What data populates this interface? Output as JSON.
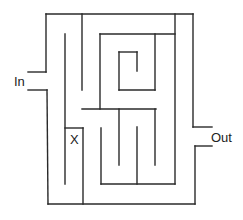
{
  "diagram": {
    "type": "maze",
    "labels": {
      "entrance": "In",
      "exit": "Out",
      "marker": "X"
    },
    "colors": {
      "background": "#ffffff",
      "wall": "#2a2a2a",
      "text": "#222222"
    },
    "walls": [
      {
        "id": "outer-top",
        "x1": 46,
        "y1": 14,
        "x2": 193,
        "y2": 14
      },
      {
        "id": "outer-left-upper",
        "x1": 46,
        "y1": 14,
        "x2": 46,
        "y2": 72
      },
      {
        "id": "in-upper-stub",
        "x1": 28,
        "y1": 72,
        "x2": 46,
        "y2": 72
      },
      {
        "id": "in-lower-stub",
        "x1": 28,
        "y1": 90,
        "x2": 47,
        "y2": 90
      },
      {
        "id": "outer-left-lower",
        "x1": 47,
        "y1": 90,
        "x2": 48,
        "y2": 204
      },
      {
        "id": "outer-bottom",
        "x1": 48,
        "y1": 204,
        "x2": 195,
        "y2": 204
      },
      {
        "id": "outer-right-upper",
        "x1": 193,
        "y1": 14,
        "x2": 193,
        "y2": 127
      },
      {
        "id": "out-upper-stub",
        "x1": 193,
        "y1": 127,
        "x2": 212,
        "y2": 127
      },
      {
        "id": "out-lower-stub",
        "x1": 195,
        "y1": 146,
        "x2": 212,
        "y2": 146
      },
      {
        "id": "outer-right-lower",
        "x1": 195,
        "y1": 146,
        "x2": 195,
        "y2": 204
      },
      {
        "id": "inner-v-82-top",
        "x1": 82,
        "y1": 14,
        "x2": 82,
        "y2": 90
      },
      {
        "id": "inner-v-65",
        "x1": 65,
        "y1": 34,
        "x2": 65,
        "y2": 184
      },
      {
        "id": "x-box-top",
        "x1": 65,
        "y1": 128,
        "x2": 83,
        "y2": 128
      },
      {
        "id": "x-box-right",
        "x1": 83,
        "y1": 128,
        "x2": 83,
        "y2": 204
      },
      {
        "id": "mid-horizontal",
        "x1": 82,
        "y1": 109,
        "x2": 156,
        "y2": 109
      },
      {
        "id": "inner-v-100-upper",
        "x1": 100,
        "y1": 34,
        "x2": 100,
        "y2": 109
      },
      {
        "id": "inner-top-horizontal",
        "x1": 100,
        "y1": 34,
        "x2": 175,
        "y2": 34
      },
      {
        "id": "inner-v-175",
        "x1": 175,
        "y1": 14,
        "x2": 175,
        "y2": 184
      },
      {
        "id": "spiral-right",
        "x1": 155,
        "y1": 34,
        "x2": 155,
        "y2": 90
      },
      {
        "id": "spiral-bottom",
        "x1": 119,
        "y1": 90,
        "x2": 155,
        "y2": 90
      },
      {
        "id": "spiral-left",
        "x1": 119,
        "y1": 52,
        "x2": 119,
        "y2": 90
      },
      {
        "id": "spiral-top",
        "x1": 119,
        "y1": 52,
        "x2": 137,
        "y2": 52
      },
      {
        "id": "spiral-hook",
        "x1": 137,
        "y1": 52,
        "x2": 137,
        "y2": 71
      },
      {
        "id": "lower-v-119",
        "x1": 119,
        "y1": 109,
        "x2": 119,
        "y2": 165
      },
      {
        "id": "lower-v-155",
        "x1": 155,
        "y1": 109,
        "x2": 155,
        "y2": 165
      },
      {
        "id": "lower-v-101",
        "x1": 101,
        "y1": 128,
        "x2": 101,
        "y2": 184
      },
      {
        "id": "lower-horizontal",
        "x1": 101,
        "y1": 184,
        "x2": 175,
        "y2": 184
      },
      {
        "id": "lower-v-137",
        "x1": 137,
        "y1": 127,
        "x2": 137,
        "y2": 184
      }
    ],
    "label_positions": {
      "entrance": {
        "x": 14,
        "y": 86
      },
      "exit": {
        "x": 211,
        "y": 142
      },
      "marker": {
        "x": 70,
        "y": 144
      }
    }
  }
}
